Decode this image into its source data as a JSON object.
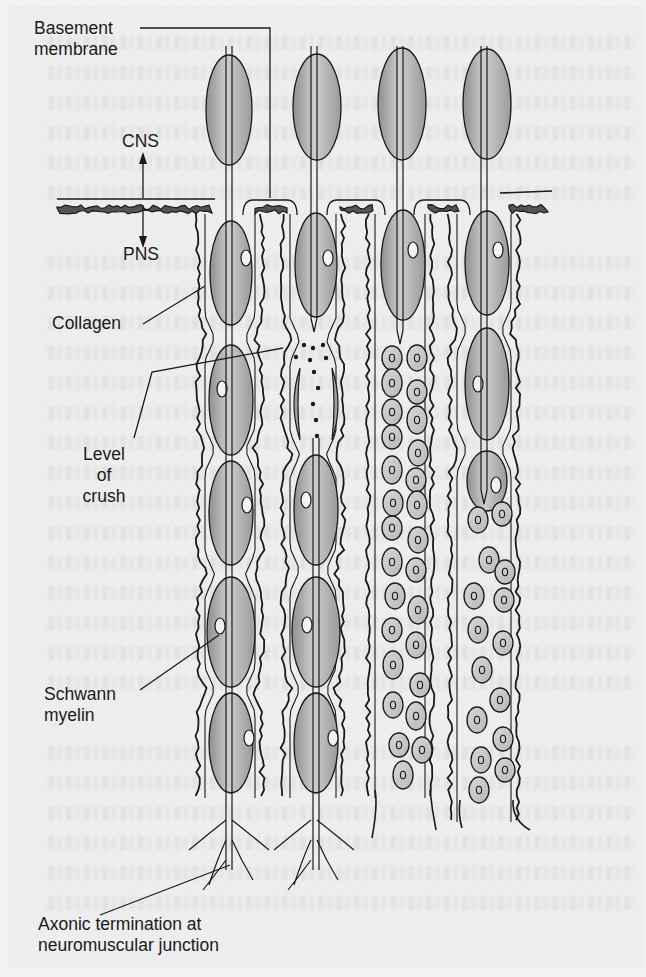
{
  "figure": {
    "kind": "nerve fiber injury and regeneration schematic",
    "fiber_count": 4,
    "boundary": {
      "upper_label": "CNS",
      "lower_label": "PNS"
    },
    "labels": {
      "basement_membrane": [
        "Basement",
        "membrane"
      ],
      "cns": "CNS",
      "pns": "PNS",
      "collagen": "Collagen",
      "level_of_crush": [
        "Level",
        "of",
        "crush"
      ],
      "schwann_myelin": [
        "Schwann",
        "myelin"
      ],
      "axonic_termination": [
        "Axonic termination at",
        "neuromuscular junction"
      ]
    },
    "fibers": [
      {
        "name": "normal",
        "state": "intact myelinated fiber with branching terminals"
      },
      {
        "name": "crushed",
        "state": "axon interrupted at level of crush, myelin debris below"
      },
      {
        "name": "degenerated",
        "state": "axon ends, Schwann cells proliferate in tube"
      },
      {
        "name": "regenerating",
        "state": "axon regrowing into Schwann cell column"
      }
    ],
    "colors": {
      "ink": "#1a1a1a",
      "myelin_fill": "#a9a9a9",
      "myelin_highlight": "#cfcfcf",
      "schwann_fill": "#c9c9c9",
      "paper": "#efefef"
    }
  }
}
